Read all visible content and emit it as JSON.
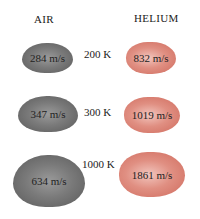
{
  "headers": {
    "air": "AIR",
    "helium": "HELIUM"
  },
  "rows": [
    {
      "temperature": "200 K",
      "air_speed": "284 m/s",
      "helium_speed": "832 m/s"
    },
    {
      "temperature": "300 K",
      "air_speed": "347 m/s",
      "helium_speed": "1019 m/s"
    },
    {
      "temperature": "1000 K",
      "air_speed": "634 m/s",
      "helium_speed": "1861 m/s"
    }
  ],
  "colors": {
    "air": "#7a7a7a",
    "helium": "#e08f82"
  }
}
